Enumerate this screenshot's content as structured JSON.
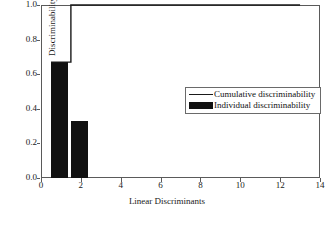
{
  "chart_data": {
    "type": "bar",
    "title": "",
    "subtitle": "",
    "xlabel": "Linear Discriminants",
    "ylabel": "Discriminability ratio",
    "xlim": [
      0,
      14
    ],
    "ylim": [
      0.0,
      1.0
    ],
    "xticks": [
      "0",
      "2",
      "4",
      "6",
      "8",
      "10",
      "12",
      "14"
    ],
    "xtick_values": [
      0,
      2,
      4,
      6,
      8,
      10,
      12,
      14
    ],
    "yticks": [
      "0.0",
      "0.2",
      "0.4",
      "0.6",
      "0.8",
      "1.0"
    ],
    "ytick_values": [
      0.0,
      0.2,
      0.4,
      0.6,
      0.8,
      1.0
    ],
    "grid": false,
    "legend_position": "center-right",
    "categories": [
      1,
      2
    ],
    "series": [
      {
        "name": "Individual discriminability",
        "type": "bar",
        "color": "#111111",
        "x": [
          1,
          2
        ],
        "values": [
          0.67,
          0.33
        ]
      },
      {
        "name": "Cumulative discriminability",
        "type": "step-line",
        "color": "#1a1a1a",
        "x": [
          1,
          2,
          13
        ],
        "values": [
          0.67,
          1.0,
          1.0
        ]
      }
    ],
    "annotations": []
  },
  "legend": {
    "entries": [
      {
        "label": "Cumulative discriminability",
        "marker": "line",
        "color": "#1a1a1a"
      },
      {
        "label": "Individual discriminability",
        "marker": "swatch",
        "color": "#111111"
      }
    ]
  }
}
